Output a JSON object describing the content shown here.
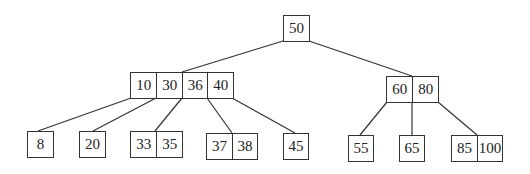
{
  "diagram": {
    "type": "B-tree",
    "root": {
      "keys": [
        "50"
      ]
    },
    "internal": [
      {
        "keys": [
          "10",
          "30",
          "36",
          "40"
        ]
      },
      {
        "keys": [
          "60",
          "80"
        ]
      }
    ],
    "leaves": [
      {
        "keys": [
          "8"
        ]
      },
      {
        "keys": [
          "20"
        ]
      },
      {
        "keys": [
          "33",
          "35"
        ]
      },
      {
        "keys": [
          "37",
          "38"
        ]
      },
      {
        "keys": [
          "45"
        ]
      },
      {
        "keys": [
          "55"
        ]
      },
      {
        "keys": [
          "65"
        ]
      },
      {
        "keys": [
          "85",
          "100"
        ]
      }
    ],
    "edges": [
      {
        "from": "root",
        "to": "internal-0"
      },
      {
        "from": "root",
        "to": "internal-1"
      },
      {
        "from": "internal-0",
        "to": "leaf-0"
      },
      {
        "from": "internal-0",
        "to": "leaf-1"
      },
      {
        "from": "internal-0",
        "to": "leaf-2"
      },
      {
        "from": "internal-0",
        "to": "leaf-3"
      },
      {
        "from": "internal-0",
        "to": "leaf-4"
      },
      {
        "from": "internal-1",
        "to": "leaf-5"
      },
      {
        "from": "internal-1",
        "to": "leaf-6"
      },
      {
        "from": "internal-1",
        "to": "leaf-7"
      }
    ]
  }
}
